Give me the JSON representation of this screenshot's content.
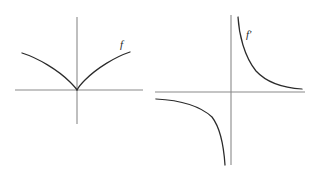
{
  "figure": {
    "background_color": "#ffffff",
    "axis_color": "#8a8a8a",
    "curve_color": "#2b2b2b",
    "panels": [
      {
        "id": "left-panel",
        "label": "f",
        "label_x": 120,
        "label_y": 48,
        "origin_x": 77,
        "origin_y": 90,
        "x_axis": {
          "x1": 15,
          "y1": 90,
          "x2": 143,
          "y2": 90
        },
        "y_axis": {
          "x1": 77,
          "y1": 17,
          "x2": 77,
          "y2": 124
        },
        "curves": [
          {
            "name": "f-left-branch",
            "path": "M 22 53 C 38 58, 58 70, 70 82 C 74 86, 76 88, 77 90"
          },
          {
            "name": "f-right-branch",
            "path": "M 77 90 C 78 88, 80 85, 85 80 C 97 68, 115 57, 130 52"
          }
        ]
      },
      {
        "id": "right-panel",
        "label": "f'",
        "label_x": 246,
        "label_y": 38,
        "origin_x": 231,
        "origin_y": 92,
        "x_axis": {
          "x1": 155,
          "y1": 92,
          "x2": 305,
          "y2": 92
        },
        "y_axis": {
          "x1": 231,
          "y1": 15,
          "x2": 231,
          "y2": 165
        },
        "curves": [
          {
            "name": "f-prime-upper-right-branch",
            "path": "M 238 17 C 239 34, 244 56, 256 71 C 268 84, 285 88, 302 89"
          },
          {
            "name": "f-prime-lower-left-branch",
            "path": "M 156 99 C 176 100, 198 104, 212 117 C 222 130, 224 150, 225 165"
          }
        ]
      }
    ]
  },
  "chart_data": {
    "type": "line",
    "title": "",
    "charts": [
      {
        "name": "f",
        "legend": [
          "f"
        ],
        "xlabel": "",
        "ylabel": "",
        "grid": false,
        "axes": {
          "x_zero_shown": true,
          "y_zero_shown": true
        },
        "series": [
          {
            "name": "f",
            "description": "Cube-root shaped curve y = x^(1/3): increasing everywhere, vertical tangent at origin, concave down for x > 0 and concave up for x < 0.",
            "x": [
              -2.2,
              -1.8,
              -1.4,
              -1.0,
              -0.6,
              -0.3,
              -0.1,
              0.0,
              0.1,
              0.3,
              0.6,
              1.0,
              1.4,
              1.8,
              2.2
            ],
            "y": [
              1.48,
              1.38,
              1.27,
              1.13,
              0.95,
              0.75,
              0.52,
              0.0,
              -0.52,
              -0.75,
              -0.95,
              -1.13,
              -1.27,
              -1.38,
              -1.48
            ]
          }
        ]
      },
      {
        "name": "f'",
        "legend": [
          "f'"
        ],
        "xlabel": "",
        "ylabel": "",
        "grid": false,
        "axes": {
          "x_zero_shown": true,
          "y_zero_shown": true
        },
        "series": [
          {
            "name": "f'",
            "description": "Derivative y = 1/(3 x^(2/3)): positive and decreasing for x > 0, negative branch in the third quadrant, vertical asymptote at x = 0 and horizontal asymptote y = 0.",
            "x": [
              -2.4,
              -1.8,
              -1.2,
              -0.8,
              -0.45,
              -0.2,
              -0.08,
              0.08,
              0.2,
              0.45,
              0.8,
              1.2,
              1.8,
              2.4
            ],
            "y": [
              -0.19,
              -0.23,
              -0.3,
              -0.39,
              -0.57,
              -0.98,
              -1.79,
              1.79,
              0.98,
              0.57,
              0.39,
              0.3,
              0.23,
              0.19
            ]
          }
        ]
      }
    ]
  }
}
